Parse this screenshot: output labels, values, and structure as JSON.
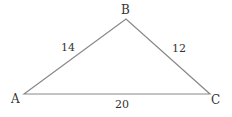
{
  "diagram": {
    "type": "triangle",
    "vertices": [
      {
        "label": "A",
        "x": 24,
        "y": 94
      },
      {
        "label": "B",
        "x": 126,
        "y": 19
      },
      {
        "label": "C",
        "x": 210,
        "y": 94
      }
    ],
    "sides": [
      {
        "from": "A",
        "to": "B",
        "length_label": "14"
      },
      {
        "from": "B",
        "to": "C",
        "length_label": "12"
      },
      {
        "from": "A",
        "to": "C",
        "length_label": "20"
      }
    ],
    "line_color": "#888888",
    "text_color": "#333333"
  }
}
